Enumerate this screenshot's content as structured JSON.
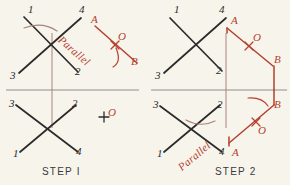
{
  "page": {
    "background_color": "#f7f4ec",
    "line_color": "#2b2b2b",
    "accent_color": "#b4412e",
    "guide_color": "#8a8a8a"
  },
  "panels": [
    {
      "id": "step-1",
      "caption": "STEP I",
      "top_figure": {
        "endpoint_labels": [
          "1",
          "4",
          "3",
          "2"
        ]
      },
      "bottom_figure": {
        "endpoint_labels": [
          "3",
          "2",
          "1",
          "4"
        ]
      },
      "annotation": {
        "script_text": "Parallel",
        "point_a": "A",
        "point_o": "O",
        "point_b": "B",
        "loose_point_o": "O"
      }
    },
    {
      "id": "step-2",
      "caption": "STEP 2",
      "top_figure": {
        "endpoint_labels": [
          "1",
          "4",
          "3",
          "2"
        ]
      },
      "bottom_figure": {
        "endpoint_labels": [
          "3",
          "2",
          "1",
          "4"
        ]
      },
      "annotation_top": {
        "point_a": "A",
        "point_o": "O",
        "point_b": "B"
      },
      "annotation_bottom": {
        "script_text": "Parallel",
        "point_a": "A",
        "point_o": "O",
        "point_b": "B"
      }
    }
  ]
}
